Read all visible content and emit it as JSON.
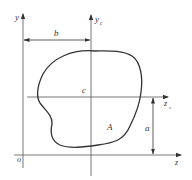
{
  "diagram": {
    "type": "cross-section centroid / parallel-axis figure",
    "axes": [
      {
        "id": "y",
        "label": "y",
        "subscript": "",
        "direction": "vertical"
      },
      {
        "id": "yc",
        "label": "y",
        "subscript": "c",
        "direction": "vertical"
      },
      {
        "id": "zc",
        "label": "z",
        "subscript": "c",
        "direction": "horizontal"
      },
      {
        "id": "z",
        "label": "z",
        "subscript": "",
        "direction": "horizontal"
      }
    ],
    "origin_label": "o",
    "centroid_label": "c",
    "area_label": "A",
    "dimensions": [
      {
        "id": "b",
        "label": "b",
        "from": "y",
        "to": "yc",
        "orientation": "horizontal"
      },
      {
        "id": "a",
        "label": "a",
        "from": "z",
        "to": "zc",
        "orientation": "vertical"
      }
    ],
    "colors": {
      "line": "#333333",
      "axis": "#555555",
      "background": "#ffffff"
    }
  }
}
